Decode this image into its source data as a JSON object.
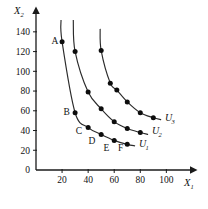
{
  "chart_data": {
    "type": "line",
    "title": "",
    "subtitle": "",
    "xlabel": "X1",
    "ylabel": "X2",
    "xlabel_base": "X",
    "xlabel_sub": "1",
    "ylabel_base": "X",
    "ylabel_sub": "2",
    "xlim": [
      0,
      112
    ],
    "ylim": [
      0,
      152
    ],
    "xticks": [
      20,
      40,
      60,
      80,
      100
    ],
    "yticks": [
      0,
      20,
      40,
      60,
      80,
      100,
      120,
      140
    ],
    "grid": false,
    "legend": "inline-right-end",
    "axis_arrows": true,
    "marker": "filled-circle",
    "series": [
      {
        "name": "U1",
        "name_base": "U",
        "name_sub": "1",
        "label_x": 79,
        "label_y": 23,
        "points": [
          {
            "x": 20,
            "y": 130,
            "label": "A"
          },
          {
            "x": 30,
            "y": 58,
            "label": "B"
          },
          {
            "x": 40,
            "y": 43,
            "label": "C"
          },
          {
            "x": 50,
            "y": 36,
            "label": "D"
          },
          {
            "x": 60,
            "y": 30,
            "label": "E"
          },
          {
            "x": 70,
            "y": 26,
            "label": "F"
          }
        ],
        "curve_start": {
          "x": 19.2,
          "y": 152
        },
        "curve_end": {
          "x": 76,
          "y": 24.5
        }
      },
      {
        "name": "U2",
        "name_base": "U",
        "name_sub": "2",
        "label_x": 89,
        "label_y": 36,
        "points": [
          {
            "x": 30,
            "y": 120,
            "label": ""
          },
          {
            "x": 40,
            "y": 79,
            "label": ""
          },
          {
            "x": 50,
            "y": 62,
            "label": ""
          },
          {
            "x": 60,
            "y": 49,
            "label": ""
          },
          {
            "x": 70,
            "y": 42,
            "label": ""
          },
          {
            "x": 80,
            "y": 38,
            "label": ""
          }
        ],
        "curve_start": {
          "x": 28.6,
          "y": 152
        },
        "curve_end": {
          "x": 86,
          "y": 36
        }
      },
      {
        "name": "U3",
        "name_base": "U",
        "name_sub": "3",
        "label_x": 99,
        "label_y": 50,
        "points": [
          {
            "x": 50,
            "y": 121,
            "label": ""
          },
          {
            "x": 57,
            "y": 88,
            "label": ""
          },
          {
            "x": 62,
            "y": 81,
            "label": ""
          },
          {
            "x": 70,
            "y": 69,
            "label": ""
          },
          {
            "x": 80,
            "y": 58,
            "label": ""
          },
          {
            "x": 90,
            "y": 53,
            "label": ""
          }
        ],
        "curve_start": {
          "x": 49.2,
          "y": 143
        },
        "curve_end": {
          "x": 96,
          "y": 51
        }
      }
    ],
    "point_labels": [
      {
        "text": "A",
        "x": 14.5,
        "y": 131
      },
      {
        "text": "B",
        "x": 23.5,
        "y": 59
      },
      {
        "text": "C",
        "x": 33,
        "y": 40
      },
      {
        "text": "D",
        "x": 43,
        "y": 30
      },
      {
        "text": "E",
        "x": 54,
        "y": 23
      },
      {
        "text": "F",
        "x": 65,
        "y": 23
      }
    ]
  }
}
